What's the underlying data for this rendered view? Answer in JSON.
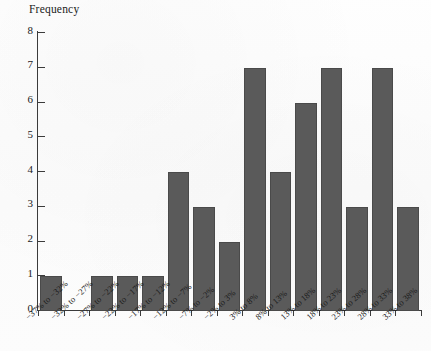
{
  "chart_data": {
    "type": "bar",
    "title": "",
    "subtitle": "",
    "xlabel": "",
    "ylabel": "Frequency",
    "ylim": [
      0,
      8
    ],
    "y_ticks": [
      0,
      1,
      2,
      3,
      4,
      5,
      6,
      7,
      8
    ],
    "grid": false,
    "legend": null,
    "bar_color": "#5a5a5a",
    "axis_color": "#3b3b3b",
    "background_color": "#fdfdfd",
    "categories": [
      "−37% to −32%",
      "−32% to −27%",
      "−27% to −22%",
      "−22% to −17%",
      "−17% to −12%",
      "−12% to −7%",
      "−7% to −2%",
      "−2% to 3%",
      "3% to 8%",
      "8% to 13%",
      "13% to 18%",
      "18% to 23%",
      "23% to 28%",
      "28% to 33%",
      "33% to 38%"
    ],
    "values": [
      1,
      0,
      1,
      1,
      1,
      4,
      3,
      2,
      7,
      4,
      6,
      7,
      3,
      7,
      3
    ]
  }
}
